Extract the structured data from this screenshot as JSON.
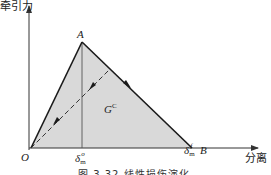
{
  "figure": {
    "y_axis_label": "牵引力",
    "x_axis_label": "分离",
    "point_origin": "O",
    "point_peak": "A",
    "point_end": "B",
    "energy_label_main": "G",
    "energy_label_sup": "C",
    "delta_symbol": "δ",
    "delta0_sup": "o",
    "delta0_sub": "m",
    "deltaf_sup": "f",
    "deltaf_sub": "m",
    "caption": "图 3.32  线性损伤演化"
  },
  "colors": {
    "fill": "#d9d9d9",
    "line": "#1a1a1a",
    "axis": "#333333",
    "background": "#ffffff"
  },
  "geometry": {
    "origin": [
      31,
      148
    ],
    "peak": [
      82,
      42
    ],
    "end": [
      192,
      148
    ],
    "unload_point": [
      109,
      70
    ],
    "x_axis_end": [
      258,
      148
    ],
    "y_axis_top": [
      29,
      6
    ]
  }
}
